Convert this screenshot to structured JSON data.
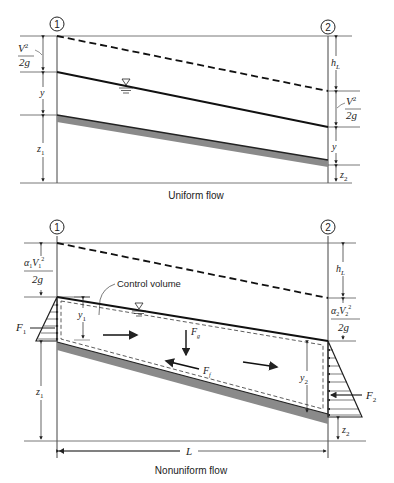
{
  "uniform": {
    "caption": "Uniform flow",
    "section1_label": "1",
    "section2_label": "2",
    "left_labels": {
      "velocity_head_num": "V",
      "velocity_head_sup": "2",
      "velocity_head_den": "2g",
      "depth": "y",
      "elevation": "z",
      "elevation_sub": "1"
    },
    "right_labels": {
      "head_loss": "h",
      "head_loss_sub": "L",
      "velocity_head_num": "V",
      "velocity_head_sup": "2",
      "velocity_head_den": "2g",
      "depth": "y",
      "elevation": "z",
      "elevation_sub": "2"
    },
    "water_surface_symbol": "∇"
  },
  "nonuniform": {
    "caption": "Nonuniform flow",
    "section1_label": "1",
    "section2_label": "2",
    "control_volume_label": "Control volume",
    "left_labels": {
      "alpha": "α",
      "alpha_sub": "1",
      "velocity": "V",
      "velocity_sub": "1",
      "velocity_sup": "2",
      "velocity_head_den": "2g",
      "depth": "y",
      "depth_sub": "1",
      "elevation": "z",
      "elevation_sub": "1",
      "force": "F",
      "force_sub": "1"
    },
    "right_labels": {
      "head_loss": "h",
      "head_loss_sub": "L",
      "alpha": "α",
      "alpha_sub": "2",
      "velocity": "V",
      "velocity_sub": "2",
      "velocity_sup": "2",
      "velocity_head_den": "2g",
      "depth": "y",
      "depth_sub": "2",
      "elevation": "z",
      "elevation_sub": "2",
      "force": "F",
      "force_sub": "2"
    },
    "gravity_force": "F",
    "gravity_force_sub": "g",
    "friction_force": "F",
    "friction_force_sub": "f",
    "length_label": "L",
    "water_surface_symbol": "∇"
  }
}
